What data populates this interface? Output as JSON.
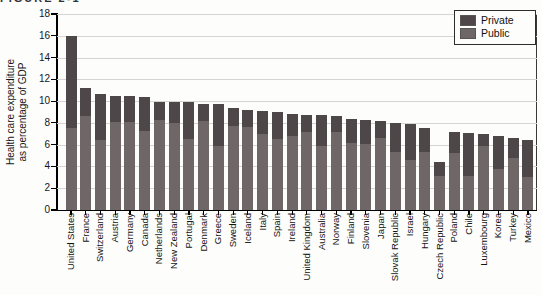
{
  "caption_fragment": "FIGURE 2-1",
  "colors": {
    "private": "#4d4749",
    "public": "#6f6668",
    "grid": "#d6d4d2",
    "axis": "#000000"
  },
  "legend": {
    "private_label": "Private",
    "public_label": "Public"
  },
  "y_axis": {
    "title_line1": "Health care expenditure",
    "title_line2": "as percentage of GDP"
  },
  "chart_data": {
    "type": "bar",
    "stacked": true,
    "title": "",
    "xlabel": "",
    "ylabel": "Health care expenditure as percentage of GDP",
    "ylim": [
      0,
      18
    ],
    "yticks": [
      0,
      2,
      4,
      6,
      8,
      10,
      12,
      14,
      16,
      18
    ],
    "grid": true,
    "legend_position": "top-right",
    "categories": [
      "United States",
      "France",
      "Switzerland",
      "Austria",
      "Germany",
      "Canada",
      "Netherlands",
      "New Zealand",
      "Portugal",
      "Denmark",
      "Greece",
      "Sweden",
      "Iceland",
      "Italy",
      "Spain",
      "Ireland",
      "United Kingdom",
      "Australia",
      "Norway",
      "Finland",
      "Slovenia",
      "Japan",
      "Slovak Republic",
      "Israel",
      "Hungary",
      "Czech Republic",
      "Poland",
      "Chile",
      "Luxembourg",
      "Korea",
      "Turkey",
      "Mexico"
    ],
    "series": [
      {
        "name": "Private",
        "values": [
          8.5,
          2.6,
          4.3,
          2.4,
          2.4,
          3.1,
          1.6,
          1.9,
          3.4,
          1.5,
          3.8,
          1.7,
          1.6,
          2.1,
          2.5,
          2.0,
          1.5,
          2.8,
          1.4,
          2.2,
          2.2,
          1.6,
          2.7,
          3.3,
          2.2,
          1.3,
          2.0,
          4.0,
          1.1,
          3.0,
          1.8,
          3.4
        ]
      },
      {
        "name": "Public",
        "values": [
          7.5,
          8.6,
          6.4,
          8.1,
          8.1,
          7.3,
          8.3,
          8.0,
          6.5,
          8.2,
          5.9,
          7.7,
          7.6,
          7.0,
          6.5,
          6.8,
          7.2,
          5.9,
          7.2,
          6.2,
          6.1,
          6.6,
          5.3,
          4.6,
          5.3,
          3.1,
          5.2,
          3.1,
          5.9,
          3.8,
          4.8,
          3.0
        ]
      }
    ],
    "totals": [
      16.0,
      11.2,
      10.7,
      10.5,
      10.5,
      10.4,
      9.9,
      9.9,
      9.9,
      9.7,
      9.7,
      9.4,
      9.2,
      9.1,
      9.0,
      8.8,
      8.7,
      8.7,
      8.6,
      8.4,
      8.3,
      8.2,
      8.0,
      7.9,
      7.5,
      4.4,
      7.2,
      7.1,
      7.0,
      6.8,
      6.6,
      6.4
    ]
  }
}
